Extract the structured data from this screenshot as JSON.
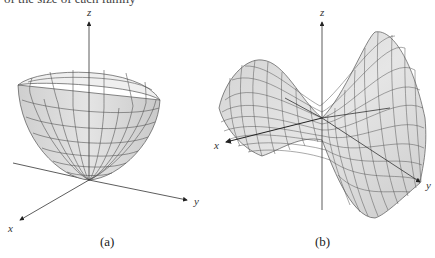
{
  "top_text": "of the size of each family",
  "figures": [
    {
      "id": "a",
      "caption": "(a)",
      "surface": "elliptic paraboloid",
      "axes": {
        "x": "x",
        "y": "y",
        "z": "z"
      }
    },
    {
      "id": "b",
      "caption": "(b)",
      "surface": "hyperbolic paraboloid (saddle)",
      "axes": {
        "x": "x",
        "y": "y",
        "z": "z"
      }
    }
  ],
  "colors": {
    "surface_fill": "#d9d9d9",
    "surface_fill_light": "#ececec",
    "grid_line": "#555555",
    "axis": "#333333"
  }
}
